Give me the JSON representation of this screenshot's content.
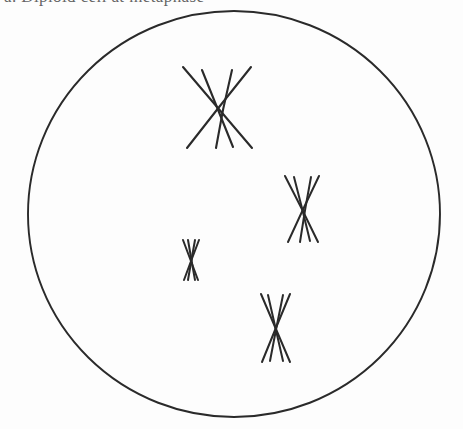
{
  "figure": {
    "kind": "biology-diagram",
    "caption_fragment": "a. Diploid cell at metaphase",
    "background_color": "#fdfdfd",
    "ink_color": "#2a2a2a",
    "width": 463,
    "height": 429
  },
  "cell": {
    "label": "cell-membrane",
    "shape": "circle",
    "center_x": 234,
    "center_y": 214,
    "radius_x": 206,
    "radius_y": 203,
    "stroke_color": "#2a2a2a",
    "stroke_width": 1.9,
    "fill": "none"
  },
  "chromosomes": [
    {
      "name": "tetrad-1-large",
      "size": "large",
      "center_x": 217,
      "center_y": 107,
      "stroke_width": 2.1,
      "strands": [
        {
          "name": "chromatid-1a",
          "x1": 183,
          "y1": 67,
          "x2": 252,
          "y2": 148
        },
        {
          "name": "chromatid-1b",
          "x1": 251,
          "y1": 67,
          "x2": 187,
          "y2": 148
        },
        {
          "name": "chromatid-1c",
          "x1": 202,
          "y1": 70,
          "x2": 233,
          "y2": 147
        },
        {
          "name": "chromatid-1d",
          "x1": 232,
          "y1": 70,
          "x2": 216,
          "y2": 148
        }
      ]
    },
    {
      "name": "tetrad-2-medium",
      "size": "medium",
      "center_x": 303,
      "center_y": 205,
      "stroke_width": 2.0,
      "strands": [
        {
          "name": "chromatid-2a",
          "x1": 285,
          "y1": 176,
          "x2": 318,
          "y2": 242
        },
        {
          "name": "chromatid-2b",
          "x1": 319,
          "y1": 176,
          "x2": 288,
          "y2": 242
        },
        {
          "name": "chromatid-2c",
          "x1": 294,
          "y1": 177,
          "x2": 310,
          "y2": 241
        },
        {
          "name": "chromatid-2d",
          "x1": 311,
          "y1": 177,
          "x2": 300,
          "y2": 242
        }
      ]
    },
    {
      "name": "tetrad-3-small",
      "size": "small",
      "center_x": 191,
      "center_y": 260,
      "stroke_width": 2.0,
      "strands": [
        {
          "name": "chromatid-3a",
          "x1": 183,
          "y1": 240,
          "x2": 198,
          "y2": 280
        },
        {
          "name": "chromatid-3b",
          "x1": 199,
          "y1": 240,
          "x2": 184,
          "y2": 280
        },
        {
          "name": "chromatid-3c",
          "x1": 188,
          "y1": 240,
          "x2": 195,
          "y2": 280
        },
        {
          "name": "chromatid-3d",
          "x1": 195,
          "y1": 240,
          "x2": 188,
          "y2": 280
        }
      ]
    },
    {
      "name": "tetrad-4-medium",
      "size": "medium",
      "center_x": 275,
      "center_y": 328,
      "stroke_width": 2.0,
      "strands": [
        {
          "name": "chromatid-4a",
          "x1": 261,
          "y1": 294,
          "x2": 290,
          "y2": 362
        },
        {
          "name": "chromatid-4b",
          "x1": 290,
          "y1": 294,
          "x2": 262,
          "y2": 362
        },
        {
          "name": "chromatid-4c",
          "x1": 268,
          "y1": 295,
          "x2": 283,
          "y2": 361
        },
        {
          "name": "chromatid-4d",
          "x1": 283,
          "y1": 295,
          "x2": 270,
          "y2": 361
        }
      ]
    }
  ]
}
